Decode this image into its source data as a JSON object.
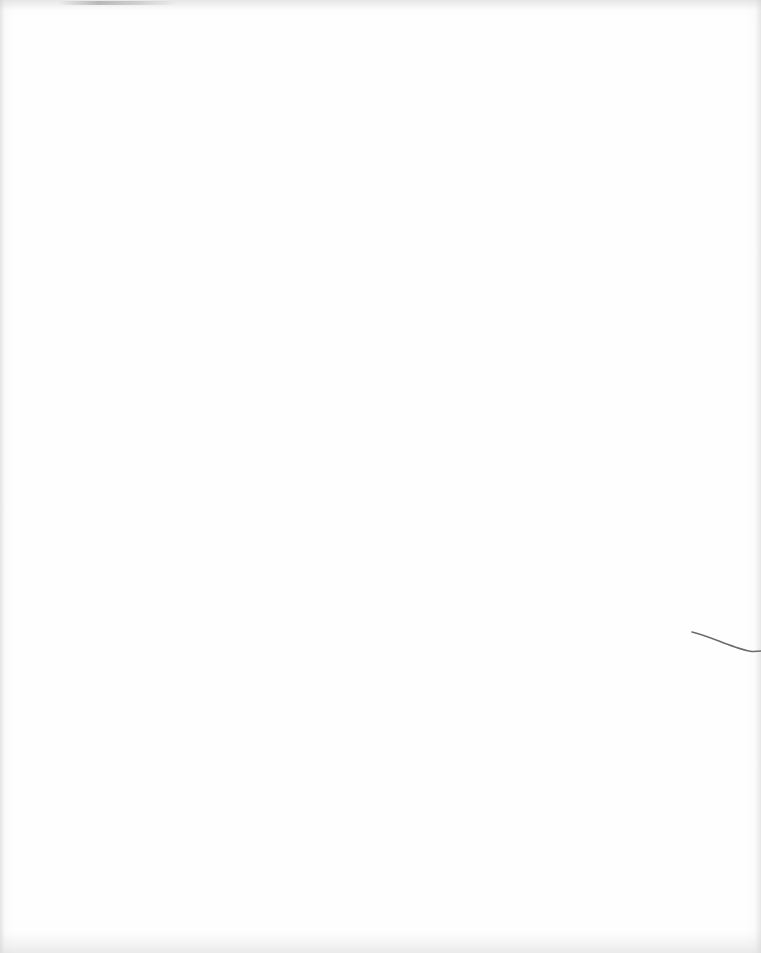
{
  "page": {
    "type": "blank-scanned-page",
    "text": "",
    "background_color": "#fefefe",
    "artifacts": [
      {
        "kind": "scanner-smudge",
        "position": "top-left edge"
      },
      {
        "kind": "hair-stroke",
        "position": "right margin, mid-lower"
      }
    ]
  }
}
